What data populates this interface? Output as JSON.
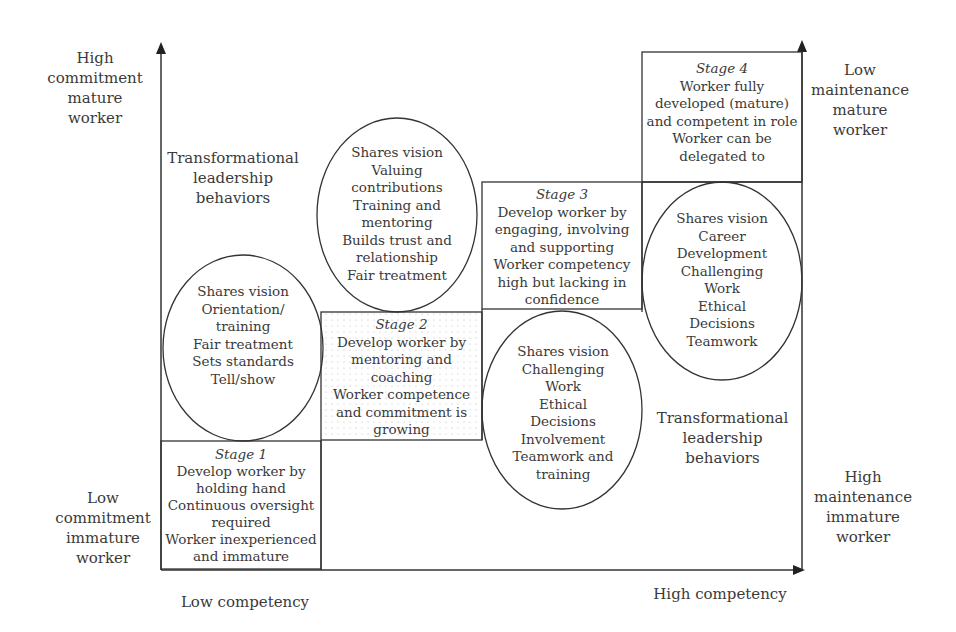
{
  "diagram": {
    "type": "staged leadership development diagram",
    "axes": {
      "y_top_label": [
        "High",
        "commitment",
        "mature",
        "worker"
      ],
      "y_bottom_label": [
        "Low",
        "commitment",
        "immature",
        "worker"
      ],
      "x_left_label": "Low competency",
      "x_right_label": "High competency",
      "right_top_label": [
        "Low",
        "maintenance",
        "mature",
        "worker"
      ],
      "right_bottom_label": [
        "High",
        "maintenance",
        "immature",
        "worker"
      ]
    },
    "side_labels": {
      "upper_left": [
        "Transformational",
        "leadership",
        "behaviors"
      ],
      "lower_right": [
        "Transformational",
        "leadership",
        "behaviors"
      ]
    },
    "stages": [
      {
        "title": "Stage 1",
        "lines": [
          "Develop worker by",
          "holding hand",
          "Continuous oversight",
          "required",
          "Worker inexperienced",
          "and immature"
        ]
      },
      {
        "title": "Stage 2",
        "lines": [
          "Develop worker by",
          "mentoring and",
          "coaching",
          "Worker competence",
          "and commitment is",
          "growing"
        ]
      },
      {
        "title": "Stage 3",
        "lines": [
          "Develop worker by",
          "engaging, involving",
          "and supporting",
          "Worker competency",
          "high but lacking in",
          "confidence"
        ]
      },
      {
        "title": "Stage 4",
        "lines": [
          "Worker fully",
          "developed (mature)",
          "and competent in role",
          "Worker can be",
          "delegated to"
        ]
      }
    ],
    "ellipses": [
      {
        "id": "stage1",
        "lines": [
          "Shares vision",
          "Orientation/",
          "training",
          "Fair treatment",
          "Sets standards",
          "Tell/show"
        ]
      },
      {
        "id": "stage2",
        "lines": [
          "Shares vision",
          "Valuing",
          "contributions",
          "Training and",
          "mentoring",
          "Builds trust and",
          "relationship",
          "Fair treatment"
        ]
      },
      {
        "id": "stage3",
        "lines": [
          "Shares vision",
          "Challenging",
          "Work",
          "Ethical",
          "Decisions",
          "Involvement",
          "Teamwork and",
          "training"
        ]
      },
      {
        "id": "stage4",
        "lines": [
          "Shares vision",
          "Career",
          "Development",
          "Challenging",
          "Work",
          "Ethical",
          "Decisions",
          "Teamwork"
        ]
      }
    ]
  }
}
